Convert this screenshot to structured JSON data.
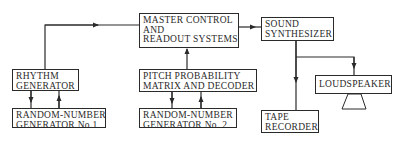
{
  "diagram": {
    "type": "block-diagram",
    "colors": {
      "line": "#2a2a2a",
      "background": "#ffffff"
    },
    "nodes": {
      "master": {
        "lines": [
          "MASTER CONTROL",
          "AND",
          "READOUT SYSTEMS"
        ]
      },
      "synth": {
        "lines": [
          "SOUND",
          "SYNTHESIZER"
        ]
      },
      "rhythm": {
        "lines": [
          "RHYTHM",
          "GENERATOR"
        ]
      },
      "rng1": {
        "lines": [
          "RANDOM-NUMBER",
          "GENERATOR No.1"
        ]
      },
      "pitch": {
        "lines": [
          "PITCH PROBABILITY",
          "MATRIX AND DECODER"
        ]
      },
      "rng2": {
        "lines": [
          "RANDOM-NUMBER",
          "GENERATOR No. 2"
        ]
      },
      "speaker": {
        "lines": [
          "LOUDSPEAKER"
        ]
      },
      "tape": {
        "lines": [
          "TAPE",
          "RECORDER"
        ]
      }
    },
    "edges": [
      {
        "from": "rhythm",
        "to": "master"
      },
      {
        "from": "pitch",
        "to": "master"
      },
      {
        "from": "master",
        "to": "synth"
      },
      {
        "from": "synth",
        "to": "tape"
      },
      {
        "from": "synth",
        "to": "speaker"
      },
      {
        "from": "rhythm",
        "to": "rng1"
      },
      {
        "from": "rng1",
        "to": "rhythm"
      },
      {
        "from": "pitch",
        "to": "rng2"
      },
      {
        "from": "rng2",
        "to": "pitch"
      }
    ]
  }
}
